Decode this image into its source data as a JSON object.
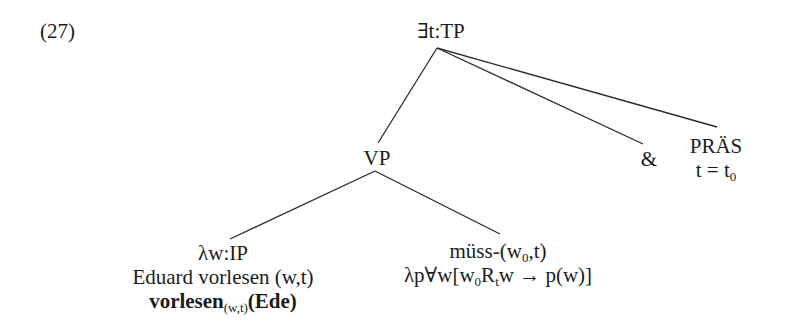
{
  "example_number": "(27)",
  "tree": {
    "root": {
      "label": "∃t:TP"
    },
    "vp": {
      "label": "VP"
    },
    "conj": {
      "label": "&"
    },
    "tense": {
      "label": "PRÄS",
      "equation": {
        "lhs": "t",
        "op": "=",
        "rhs_base": "t",
        "rhs_sub": "0"
      }
    },
    "ip": {
      "label": "λw:IP",
      "gloss": "Eduard vorlesen (w,t)",
      "formula": {
        "pred": "vorlesen",
        "pred_sub": "(w,t)",
        "arg": "(Ede)"
      }
    },
    "modal": {
      "line1": {
        "pre": "müss-(w",
        "sub": "0",
        "post": ",t)"
      },
      "line2": {
        "pre": "λp∀w[w",
        "sub1": "0",
        "mid": "R",
        "sub2": "t",
        "post": "w → p(w)]"
      }
    }
  }
}
